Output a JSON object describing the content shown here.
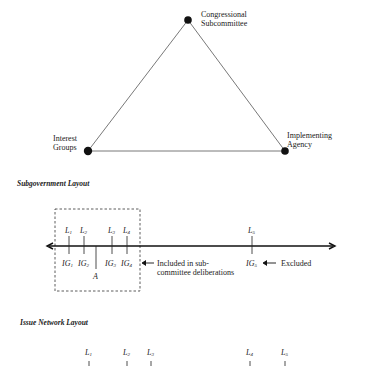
{
  "triangle": {
    "nodes": [
      {
        "id": "subcommittee",
        "label_line1": "Congressional",
        "label_line2": "Subcommittee"
      },
      {
        "id": "interest-groups",
        "label_line1": "Interest",
        "label_line2": "Groups"
      },
      {
        "id": "agency",
        "label_line1": "Implementing",
        "label_line2": "Agency"
      }
    ]
  },
  "subgovernment": {
    "title": "Subgovernment Layout",
    "legislators": [
      "L",
      "L",
      "L",
      "L",
      "L"
    ],
    "legislator_subs": [
      "1",
      "2",
      "3",
      "4",
      "5"
    ],
    "groups": [
      "IG",
      "IG",
      "IG",
      "IG",
      "IG"
    ],
    "group_subs": [
      "1",
      "2",
      "3",
      "4",
      "5"
    ],
    "agency_label": "A",
    "included_line1": "Included in sub-",
    "included_line2": "committee deliberations",
    "excluded_label": "Excluded"
  },
  "issue_network": {
    "title": "Issue Network Layout",
    "legislators": [
      "L",
      "L",
      "L",
      "L",
      "L"
    ],
    "legislator_subs": [
      "1",
      "2",
      "3",
      "4",
      "5"
    ]
  },
  "colors": {
    "ink": "#1a1a1a",
    "line": "#555555"
  }
}
